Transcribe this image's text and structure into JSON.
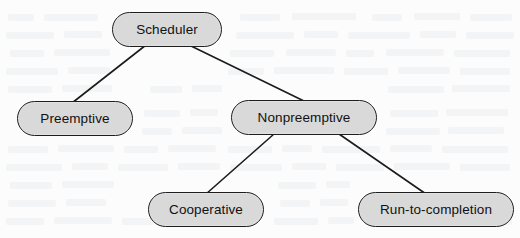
{
  "diagram": {
    "background_color": "#fcfcfc",
    "node_fill_color": "#d9d9d9",
    "node_border_color": "#1e1e1e",
    "edge_color": "#1b1b1b",
    "text_color": "#111111",
    "nodes": [
      {
        "id": "scheduler",
        "label": "Scheduler",
        "x": 112,
        "y": 12,
        "width": 110,
        "height": 35
      },
      {
        "id": "preemptive",
        "label": "Preemptive",
        "x": 17,
        "y": 101,
        "width": 116,
        "height": 35
      },
      {
        "id": "nonpreemptive",
        "label": "Nonpreemptive",
        "x": 231,
        "y": 100,
        "width": 146,
        "height": 35
      },
      {
        "id": "cooperative",
        "label": "Cooperative",
        "x": 148,
        "y": 192,
        "width": 116,
        "height": 35
      },
      {
        "id": "run-to-completion",
        "label": "Run-to-completion",
        "x": 358,
        "y": 192,
        "width": 156,
        "height": 35
      }
    ],
    "edges": [
      {
        "id": "scheduler-to-preemptive",
        "from": "scheduler",
        "to": "preemptive",
        "x1": 146,
        "y1": 45,
        "x2": 72,
        "y2": 103
      },
      {
        "id": "scheduler-to-nonpreemptive",
        "from": "scheduler",
        "to": "nonpreemptive",
        "x1": 189,
        "y1": 45,
        "x2": 306,
        "y2": 102
      },
      {
        "id": "nonpreemptive-to-cooperative",
        "from": "nonpreemptive",
        "to": "cooperative",
        "x1": 274,
        "y1": 134,
        "x2": 206,
        "y2": 194
      },
      {
        "id": "nonpreemptive-to-run-to-completion",
        "from": "nonpreemptive",
        "to": "run-to-completion",
        "x1": 339,
        "y1": 134,
        "x2": 426,
        "y2": 194
      }
    ]
  }
}
